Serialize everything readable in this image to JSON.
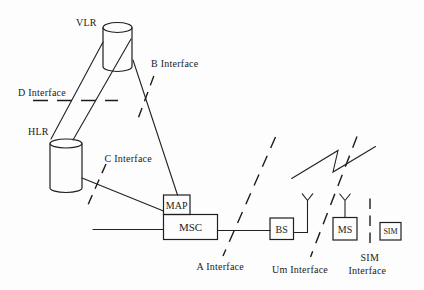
{
  "figure": {
    "colors": {
      "ink": "#1f1f1f",
      "background": "#fdfdfd"
    },
    "nodes": {
      "vlr": "VLR",
      "hlr": "HLR",
      "map": "MAP",
      "msc": "MSC",
      "bs": "BS",
      "ms": "MS",
      "sim": "SIM"
    },
    "interfaces": {
      "d": "D Interface",
      "b": "B Interface",
      "c": "C Interface",
      "a": "A Interface",
      "um": "Um Interface",
      "sim_line1": "SIM",
      "sim_line2": "Interface"
    },
    "icons": {
      "bs_antenna": "antenna-icon",
      "ms_antenna": "antenna-icon",
      "radio_break": "zigzag-radio-link-icon"
    }
  }
}
